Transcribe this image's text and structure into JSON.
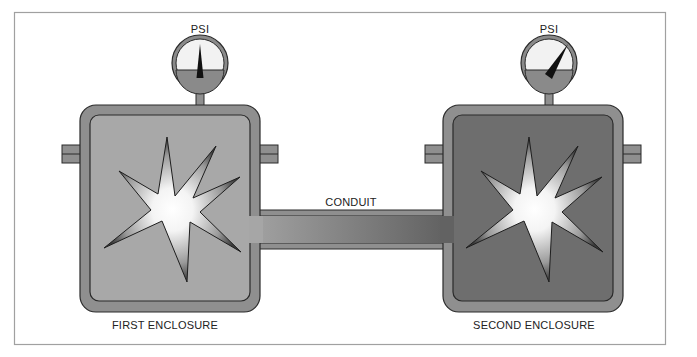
{
  "labels": {
    "gauge_left": "PSI",
    "gauge_right": "PSI",
    "conduit": "CONDUIT",
    "first_enclosure": "FIRST ENCLOSURE",
    "second_enclosure": "SECOND ENCLOSURE"
  },
  "icons": {
    "gauge": "pressure-gauge-icon",
    "explosion": "explosion-burst-icon"
  },
  "gauges": {
    "left": {
      "needle": "vertical",
      "reading": "low"
    },
    "right": {
      "needle": "angled-right",
      "reading": "high"
    }
  },
  "colors": {
    "frame": "#a0a0a0",
    "wall": "#8f8f8f",
    "outline": "#2a2a2a",
    "first_interior": "#a8a8a8",
    "second_interior": "#6e6e6e",
    "gauge_face": "#f2f2f2",
    "gauge_lower": "#8a8a8a"
  }
}
